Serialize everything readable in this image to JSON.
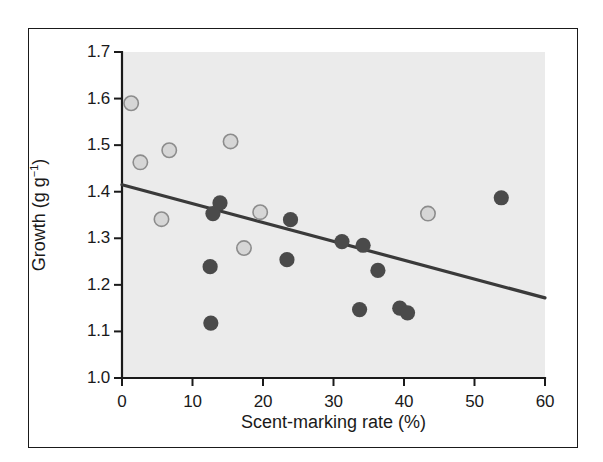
{
  "figure": {
    "background_color": "#ffffff",
    "panel_color": "#ebebeb",
    "frame_color": "#1a1a1a"
  },
  "chart_data": {
    "type": "scatter",
    "title": "",
    "xlabel": "Scent-marking rate (%)",
    "ylabel_text": "Growth (g g",
    "ylabel_sup": "−1",
    "ylabel_tail": ")",
    "ylabel_full": "Growth (g g⁻¹)",
    "xlim": [
      0,
      60
    ],
    "ylim": [
      1.0,
      1.7
    ],
    "xticks": [
      0,
      10,
      20,
      30,
      40,
      50,
      60
    ],
    "xtick_labels": [
      "0",
      "10",
      "20",
      "30",
      "40",
      "50",
      "60"
    ],
    "yticks": [
      1.0,
      1.1,
      1.2,
      1.3,
      1.4,
      1.5,
      1.6,
      1.7
    ],
    "ytick_labels": [
      "1.0",
      "1.1",
      "1.2",
      "1.3",
      "1.4",
      "1.5",
      "1.6",
      "1.7"
    ],
    "grid": false,
    "legend": null,
    "series": [
      {
        "name": "open-circles",
        "marker": "open-circle",
        "fill_color": "#d6d6d6",
        "edge_color": "#8c8c8c",
        "points": [
          {
            "x": 1.3,
            "y": 1.59
          },
          {
            "x": 2.6,
            "y": 1.463
          },
          {
            "x": 6.7,
            "y": 1.489
          },
          {
            "x": 5.6,
            "y": 1.341
          },
          {
            "x": 15.4,
            "y": 1.508
          },
          {
            "x": 17.3,
            "y": 1.279
          },
          {
            "x": 19.6,
            "y": 1.356
          },
          {
            "x": 43.4,
            "y": 1.353
          }
        ]
      },
      {
        "name": "filled-circles",
        "marker": "filled-circle",
        "fill_color": "#4a4a4a",
        "edge_color": "#4a4a4a",
        "points": [
          {
            "x": 12.6,
            "y": 1.118
          },
          {
            "x": 12.5,
            "y": 1.239
          },
          {
            "x": 12.9,
            "y": 1.353
          },
          {
            "x": 13.9,
            "y": 1.376
          },
          {
            "x": 23.4,
            "y": 1.254
          },
          {
            "x": 23.9,
            "y": 1.34
          },
          {
            "x": 31.2,
            "y": 1.293
          },
          {
            "x": 33.7,
            "y": 1.147
          },
          {
            "x": 34.2,
            "y": 1.285
          },
          {
            "x": 36.3,
            "y": 1.231
          },
          {
            "x": 39.4,
            "y": 1.15
          },
          {
            "x": 40.5,
            "y": 1.14
          },
          {
            "x": 53.8,
            "y": 1.387
          }
        ]
      }
    ],
    "trendline": {
      "name": "regression-line",
      "color": "#3a3a3a",
      "x_start": 0,
      "y_start": 1.415,
      "x_end": 60,
      "y_end": 1.172
    }
  }
}
